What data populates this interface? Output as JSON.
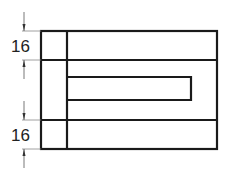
{
  "drawing": {
    "type": "technical-drawing",
    "line_color": "#1a1a1a",
    "dim_color": "#555555",
    "dimensions": [
      {
        "label": "16",
        "position": "top"
      },
      {
        "label": "16",
        "position": "bottom"
      }
    ]
  }
}
